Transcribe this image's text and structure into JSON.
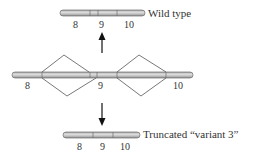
{
  "diagram": {
    "top": {
      "caption": "Wild type",
      "exons": [
        "8",
        "9",
        "10"
      ]
    },
    "middle": {
      "exons": [
        "8",
        "9",
        "10"
      ],
      "splice_pattern": "alternative splicing junctions connecting exon 8 to 9 and 9 to 10"
    },
    "bottom": {
      "caption": "Truncated “variant 3”",
      "exons": [
        "8",
        "9",
        "10"
      ]
    },
    "arrows": [
      "up-arrow-to-wild-type",
      "down-arrow-to-variant-3"
    ],
    "colors": {
      "bar_fill": "#bdbdbd",
      "bar_highlight": "#e0e0e0",
      "bar_outline": "#6e6e6e",
      "line": "#555555",
      "arrow": "#111111"
    }
  }
}
